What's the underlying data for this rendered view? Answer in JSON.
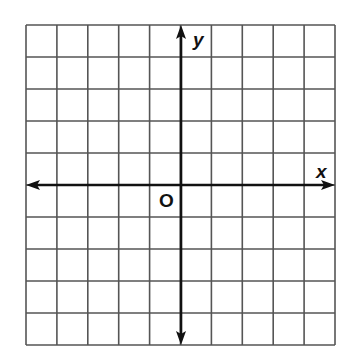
{
  "figure": {
    "type": "coordinate-plane",
    "grid": {
      "columns": 10,
      "rows": 10,
      "left": 26,
      "top": 25,
      "right": 335,
      "bottom": 345,
      "line_color": "#555555",
      "line_width": 1.6
    },
    "axes": {
      "origin_px": [
        181,
        185
      ],
      "color": "#111111",
      "width": 2.6,
      "x_arrows": "both",
      "y_arrows": "both"
    },
    "labels": {
      "x_axis": "x",
      "y_axis": "y",
      "origin": "O"
    }
  }
}
